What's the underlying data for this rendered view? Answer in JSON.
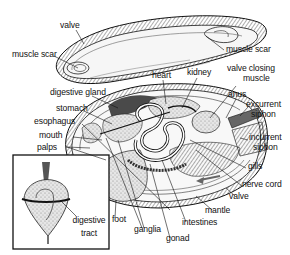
{
  "diagram": {
    "colors": {
      "ink": "#111111",
      "shell_fill": "#f4f4f4",
      "organ_fill": "#d9d9d9",
      "dark_fill": "#555555",
      "background": "#ffffff"
    },
    "labels": {
      "valve_top": "valve",
      "muscle_scar_left": "muscle scar",
      "muscle_scar_right": "muscle scar",
      "heart": "heart",
      "kidney": "kidney",
      "valve_closing_muscle_1": "valve closing",
      "valve_closing_muscle_2": "muscle",
      "digestive_gland": "digestive gland",
      "stomach": "stomach",
      "esophagus": "esophagus",
      "mouth": "mouth",
      "palps": "palps",
      "anus": "anus",
      "excurrent_siphon_1": "excurrent",
      "excurrent_siphon_2": "siphon",
      "incurrent_siphon_1": "incurrent",
      "incurrent_siphon_2": "siphon",
      "gills": "gills",
      "nerve_cord": "nerve cord",
      "valve_bottom": "valve",
      "mantle": "mantle",
      "intestines": "intestines",
      "gonad": "gonad",
      "ganglia": "ganglia",
      "foot": "foot",
      "digestive_tract_1": "digestive",
      "digestive_tract_2": "tract"
    },
    "inset": {
      "description": "digestive tract inset"
    }
  }
}
